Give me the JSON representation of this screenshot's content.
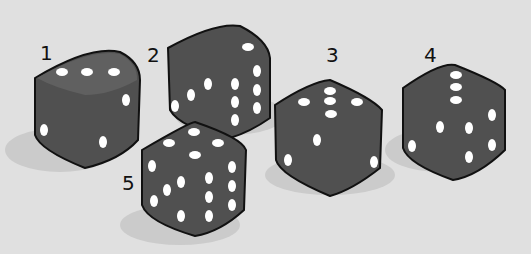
{
  "colors": {
    "background": "#e0e0e0",
    "die_top": "#5e5e5e",
    "die_left": "#555555",
    "die_right": "#4a4a4a",
    "pip": "#ffffff",
    "shadow": "#cbcbcb"
  },
  "dice": [
    {
      "label": "1",
      "top": 3,
      "left": 2,
      "right": 2
    },
    {
      "label": "2",
      "top": 1,
      "left": 3,
      "right": 6
    },
    {
      "label": "3",
      "top": 5,
      "left": 2,
      "right": 1
    },
    {
      "label": "4",
      "top": 3,
      "left": 2,
      "right": 4
    },
    {
      "label": "5",
      "top": 4,
      "left": 5,
      "right": 6
    }
  ]
}
